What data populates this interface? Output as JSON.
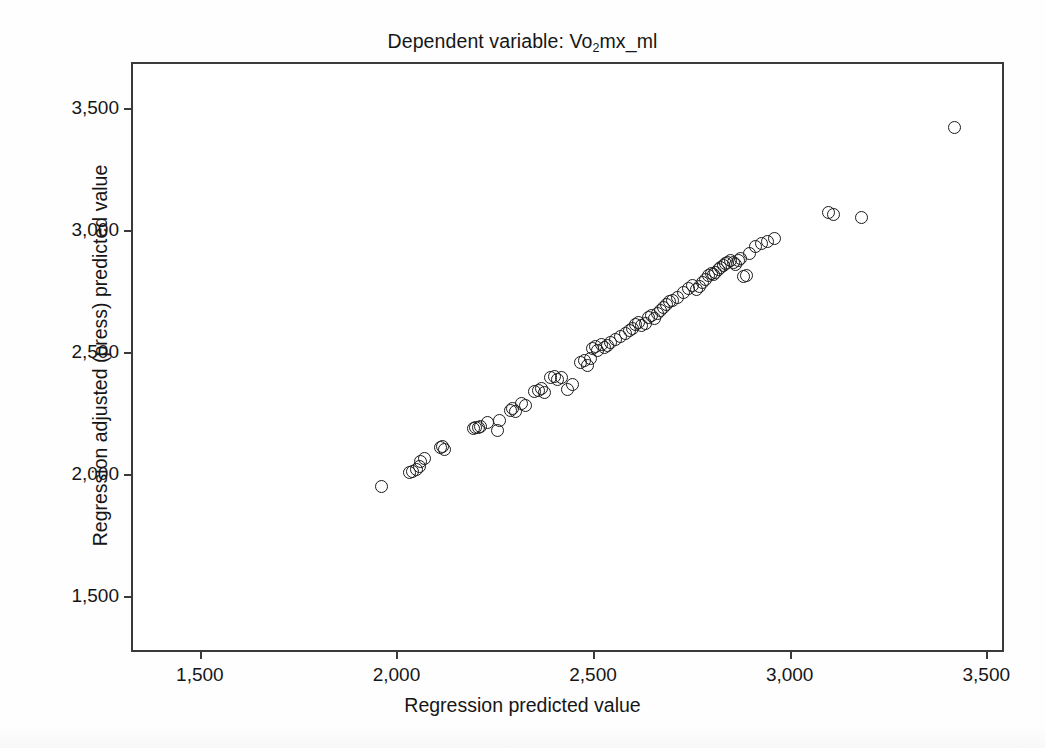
{
  "chart_data": {
    "type": "scatter",
    "title": "Dependent variable: Vo2mx_ml",
    "title_main": "Dependent variable: Vo",
    "title_sub": "2",
    "title_tail": "mx_ml",
    "xlabel": "Regression predicted value",
    "ylabel": "Regression adjusted (press) predicted value",
    "xlim": [
      1330,
      3540
    ],
    "ylim": [
      1280,
      3680
    ],
    "xticks": [
      1500,
      2000,
      2500,
      3000,
      3500
    ],
    "yticks": [
      1500,
      2000,
      2500,
      3000,
      3500
    ],
    "xticklabels": [
      "1,500",
      "2,000",
      "2,500",
      "3,000",
      "3,500"
    ],
    "yticklabels": [
      "1,500",
      "2,000",
      "2,500",
      "3,000",
      "3,500"
    ],
    "grid": false,
    "legend": false,
    "marker": "open-circle",
    "marker_color": "#1a1a1a",
    "marker_size": 13,
    "n_points": 94,
    "x": [
      1963,
      2032,
      2041,
      2052,
      2061,
      2058,
      2072,
      2112,
      2118,
      2122,
      2196,
      2202,
      2208,
      2213,
      2232,
      2257,
      2262,
      2290,
      2296,
      2303,
      2317,
      2329,
      2352,
      2361,
      2369,
      2376,
      2392,
      2401,
      2409,
      2420,
      2436,
      2447,
      2468,
      2477,
      2486,
      2493,
      2499,
      2507,
      2512,
      2521,
      2530,
      2536,
      2544,
      2556,
      2570,
      2583,
      2592,
      2601,
      2609,
      2616,
      2624,
      2633,
      2641,
      2648,
      2657,
      2663,
      2672,
      2679,
      2687,
      2694,
      2702,
      2716,
      2729,
      2742,
      2753,
      2762,
      2771,
      2778,
      2786,
      2793,
      2800,
      2806,
      2812,
      2818,
      2824,
      2831,
      2837,
      2843,
      2850,
      2856,
      2862,
      2869,
      2876,
      2882,
      2890,
      2898,
      2912,
      2928,
      2944,
      2961,
      3098,
      3112,
      3183,
      3420
    ],
    "y": [
      1949,
      2008,
      2012,
      2021,
      2052,
      2031,
      2064,
      2108,
      2113,
      2102,
      2188,
      2193,
      2190,
      2196,
      2211,
      2178,
      2219,
      2262,
      2268,
      2257,
      2290,
      2282,
      2338,
      2344,
      2350,
      2333,
      2396,
      2402,
      2388,
      2398,
      2348,
      2367,
      2458,
      2466,
      2447,
      2472,
      2516,
      2523,
      2508,
      2531,
      2519,
      2527,
      2539,
      2550,
      2564,
      2576,
      2589,
      2598,
      2612,
      2623,
      2607,
      2618,
      2642,
      2651,
      2636,
      2660,
      2671,
      2683,
      2694,
      2706,
      2713,
      2722,
      2744,
      2762,
      2774,
      2758,
      2768,
      2786,
      2797,
      2812,
      2824,
      2819,
      2828,
      2838,
      2846,
      2853,
      2862,
      2869,
      2877,
      2868,
      2858,
      2875,
      2882,
      2808,
      2812,
      2902,
      2934,
      2946,
      2952,
      2966,
      3072,
      3062,
      3050,
      3418
    ]
  }
}
